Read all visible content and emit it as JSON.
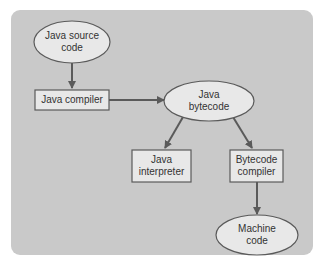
{
  "diagram": {
    "nodes": [
      {
        "id": "java-source-code",
        "shape": "ellipse",
        "line1": "Java source",
        "line2": "code"
      },
      {
        "id": "java-compiler",
        "shape": "rect",
        "line1": "Java compiler"
      },
      {
        "id": "java-bytecode",
        "shape": "ellipse",
        "line1": "Java",
        "line2": "bytecode"
      },
      {
        "id": "java-interpreter",
        "shape": "rect",
        "line1": "Java",
        "line2": "interpreter"
      },
      {
        "id": "bytecode-compiler",
        "shape": "rect",
        "line1": "Bytecode",
        "line2": "compiler"
      },
      {
        "id": "machine-code",
        "shape": "ellipse",
        "line1": "Machine",
        "line2": "code"
      }
    ],
    "edges": [
      {
        "from": "java-source-code",
        "to": "java-compiler"
      },
      {
        "from": "java-compiler",
        "to": "java-bytecode"
      },
      {
        "from": "java-bytecode",
        "to": "java-interpreter"
      },
      {
        "from": "java-bytecode",
        "to": "bytecode-compiler"
      },
      {
        "from": "bytecode-compiler",
        "to": "machine-code"
      }
    ],
    "colors": {
      "panel": "#c9c9c9",
      "node_fill": "#e8e8e8",
      "stroke": "#5a5a5a",
      "text": "#333333"
    }
  }
}
